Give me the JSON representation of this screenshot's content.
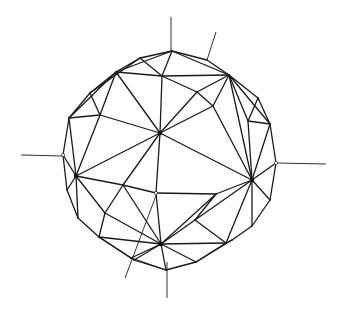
{
  "figure": {
    "type": "geodesic-sphere-line-drawing",
    "stroke_color": "#1a1a1a",
    "background_color": "#ffffff"
  },
  "axes": [
    {
      "name": "top-vertical-axis",
      "x1": 171,
      "y1": 17,
      "x2": 171,
      "y2": 52
    },
    {
      "name": "top-right-axis",
      "x1": 216,
      "y1": 32,
      "x2": 207,
      "y2": 60
    },
    {
      "name": "left-axis",
      "x1": 21,
      "y1": 155,
      "x2": 64,
      "y2": 156
    },
    {
      "name": "right-axis",
      "x1": 277,
      "y1": 163,
      "x2": 326,
      "y2": 164
    },
    {
      "name": "bottom-axis",
      "x1": 167,
      "y1": 262,
      "x2": 167,
      "y2": 298
    },
    {
      "name": "bottom-left-diagonal-axis",
      "x1": 157,
      "y1": 193,
      "x2": 125,
      "y2": 278
    }
  ],
  "vertices": {
    "T": [
      172,
      51
    ],
    "TR1": [
      207,
      60
    ],
    "TR2": [
      229,
      75
    ],
    "TR3": [
      258,
      98
    ],
    "R1": [
      270,
      124
    ],
    "R2": [
      276,
      163
    ],
    "R3": [
      270,
      200
    ],
    "R4": [
      252,
      226
    ],
    "BR1": [
      232,
      240
    ],
    "BR2": [
      196,
      262
    ],
    "B": [
      166,
      270
    ],
    "BL1": [
      134,
      260
    ],
    "BL2": [
      99,
      237
    ],
    "L1": [
      78,
      218
    ],
    "L2": [
      67,
      190
    ],
    "L3": [
      63,
      155
    ],
    "L4": [
      69,
      118
    ],
    "TL1": [
      90,
      93
    ],
    "TL2": [
      116,
      72
    ],
    "TL3": [
      140,
      58
    ],
    "C": [
      160,
      133
    ],
    "HL": [
      76,
      176
    ],
    "HR": [
      252,
      180
    ],
    "HB": [
      161,
      244
    ],
    "I1": [
      162,
      76
    ],
    "I2": [
      197,
      92
    ],
    "I3": [
      213,
      106
    ],
    "I4": [
      100,
      115
    ],
    "I5": [
      248,
      121
    ],
    "I6": [
      123,
      185
    ],
    "I7": [
      156,
      193
    ],
    "I8": [
      216,
      194
    ],
    "I9": [
      105,
      213
    ],
    "I10": [
      195,
      220
    ],
    "I11": [
      131,
      258
    ],
    "I12": [
      226,
      243
    ],
    "I13": [
      87,
      118
    ]
  },
  "edges": [
    [
      "T",
      "TR1"
    ],
    [
      "TR1",
      "TR2"
    ],
    [
      "TR2",
      "TR3"
    ],
    [
      "TR3",
      "R1"
    ],
    [
      "R1",
      "R2"
    ],
    [
      "R2",
      "R3"
    ],
    [
      "R3",
      "R4"
    ],
    [
      "R4",
      "BR1"
    ],
    [
      "BR1",
      "BR2"
    ],
    [
      "BR2",
      "B"
    ],
    [
      "B",
      "BL1"
    ],
    [
      "BL1",
      "BL2"
    ],
    [
      "BL2",
      "L1"
    ],
    [
      "L1",
      "L2"
    ],
    [
      "L2",
      "L3"
    ],
    [
      "L3",
      "L4"
    ],
    [
      "L4",
      "TL1"
    ],
    [
      "TL1",
      "TL2"
    ],
    [
      "TL2",
      "TL3"
    ],
    [
      "TL3",
      "T"
    ],
    [
      "T",
      "I1"
    ],
    [
      "TL2",
      "I1"
    ],
    [
      "I1",
      "TR2"
    ],
    [
      "TR1",
      "TR2"
    ],
    [
      "T",
      "TR2"
    ],
    [
      "TL2",
      "T"
    ],
    [
      "TL2",
      "I4"
    ],
    [
      "TL2",
      "C"
    ],
    [
      "I1",
      "C"
    ],
    [
      "I1",
      "I2"
    ],
    [
      "I2",
      "TR2"
    ],
    [
      "I2",
      "C"
    ],
    [
      "I2",
      "I3"
    ],
    [
      "TR2",
      "I3"
    ],
    [
      "I3",
      "C"
    ],
    [
      "TR2",
      "I5"
    ],
    [
      "TR3",
      "I5"
    ],
    [
      "TR2",
      "R1"
    ],
    [
      "I5",
      "R1"
    ],
    [
      "I5",
      "HR"
    ],
    [
      "I3",
      "HR"
    ],
    [
      "TR2",
      "HR"
    ],
    [
      "R1",
      "HR"
    ],
    [
      "R2",
      "HR"
    ],
    [
      "R3",
      "HR"
    ],
    [
      "R4",
      "HR"
    ],
    [
      "TL1",
      "I4"
    ],
    [
      "L4",
      "I4"
    ],
    [
      "L4",
      "HL"
    ],
    [
      "I4",
      "HL"
    ],
    [
      "TL1",
      "L4"
    ],
    [
      "I4",
      "C"
    ],
    [
      "C",
      "HL"
    ],
    [
      "C",
      "I6"
    ],
    [
      "C",
      "I7"
    ],
    [
      "C",
      "HR"
    ],
    [
      "L3",
      "HL"
    ],
    [
      "L2",
      "HL"
    ],
    [
      "L1",
      "HL"
    ],
    [
      "HL",
      "I6"
    ],
    [
      "HL",
      "I9"
    ],
    [
      "I6",
      "I7"
    ],
    [
      "I6",
      "I9"
    ],
    [
      "I7",
      "I8"
    ],
    [
      "I8",
      "HR"
    ],
    [
      "I7",
      "HB"
    ],
    [
      "I6",
      "HB"
    ],
    [
      "I9",
      "HB"
    ],
    [
      "I9",
      "BL2"
    ],
    [
      "BL2",
      "HB"
    ],
    [
      "I8",
      "HB"
    ],
    [
      "I8",
      "I10"
    ],
    [
      "I10",
      "HB"
    ],
    [
      "I10",
      "HR"
    ],
    [
      "I10",
      "I12"
    ],
    [
      "I12",
      "HR"
    ],
    [
      "I12",
      "HB"
    ],
    [
      "BR1",
      "I12"
    ],
    [
      "BR2",
      "I12"
    ],
    [
      "BR2",
      "HB"
    ],
    [
      "B",
      "HB"
    ],
    [
      "BL1",
      "HB"
    ],
    [
      "I11",
      "HB"
    ],
    [
      "I11",
      "BL2"
    ],
    [
      "I11",
      "B"
    ],
    [
      "TL3",
      "I1"
    ],
    [
      "TL2",
      "TL3"
    ],
    [
      "L4",
      "TL2"
    ],
    [
      "TL1",
      "TL3"
    ]
  ],
  "hubs": [
    "C",
    "HL",
    "HR",
    "HB"
  ],
  "open_nodes": [
    "I7",
    "R2",
    "L3"
  ]
}
